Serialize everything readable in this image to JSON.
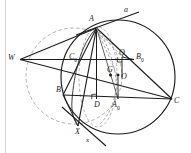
{
  "figure": {
    "kind": "euclidean-geometry-diagram",
    "width": 191,
    "height": 153,
    "background": "#ffffff",
    "stroke_dark": "#1c1c1c",
    "stroke_mid": "#555555",
    "stroke_dashed": "#8a8a8a",
    "margin_rule_color": "#c9c9c9"
  },
  "labels": {
    "A": "A",
    "a_line": "a",
    "B": "B",
    "C": "C",
    "W": "W",
    "O": "O",
    "G": "G",
    "Q": "Q",
    "D": "D",
    "X": "X",
    "x_line": "x",
    "A0_base": "A",
    "A0_sub": "0",
    "B0_base": "B",
    "B0_sub": "0",
    "C0_base": "C",
    "C0_sub": "0"
  },
  "points": [
    {
      "name": "A",
      "x": 96.5,
      "y": 28.0,
      "label": "A",
      "label_dx": -7.5,
      "label_dy": -9.5,
      "marked": false
    },
    {
      "name": "B",
      "x": 63.0,
      "y": 95.0,
      "label": "B",
      "label_dx": -8.0,
      "label_dy": -1.0,
      "marked": false
    },
    {
      "name": "C",
      "x": 172.0,
      "y": 99.0,
      "label": "C",
      "label_dx": 2.5,
      "label_dy": 3.0,
      "marked": false
    },
    {
      "name": "W",
      "x": 20.0,
      "y": 59.5,
      "label": "W",
      "label_dx": -10.0,
      "label_dy": -1.0,
      "marked": false
    },
    {
      "name": "O",
      "x": 118.0,
      "y": 77.0,
      "label": "O",
      "label_dx": 3.0,
      "label_dy": 3.5,
      "marked": true
    },
    {
      "name": "G",
      "x": 110.5,
      "y": 75.0,
      "label": "G",
      "label_dx": -1.5,
      "label_dy": -3.0,
      "marked": true
    },
    {
      "name": "Q",
      "x": 122.0,
      "y": 57.0,
      "label": "Q",
      "label_dx": -1.0,
      "label_dy": -3.0,
      "marked": false
    },
    {
      "name": "D",
      "x": 96.5,
      "y": 99.0,
      "label": "D",
      "label_dx": -1.0,
      "label_dy": 8.0,
      "marked": false
    },
    {
      "name": "X",
      "x": 78.0,
      "y": 126.0,
      "label": "X",
      "label_dx": -2.0,
      "label_dy": 8.0,
      "marked": false
    },
    {
      "name": "A0",
      "x": 118.0,
      "y": 99.0,
      "label": "A0",
      "label_dx": 0.5,
      "label_dy": 8.0,
      "marked": false
    },
    {
      "name": "B0",
      "x": 134.0,
      "y": 59.5,
      "label": "B0",
      "label_dx": 3.0,
      "label_dy": -1.0,
      "marked": false
    },
    {
      "name": "C0",
      "x": 79.5,
      "y": 59.5,
      "label": "C0",
      "label_dx": -8.5,
      "label_dy": -1.5,
      "marked": false
    }
  ],
  "elements": {
    "circumcircle": {
      "cx": 118.0,
      "cy": 77.0,
      "r": 57.0,
      "style": "solid"
    },
    "dashed_circle": {
      "cx": 74.0,
      "cy": 76.0,
      "r": 48.0,
      "style": "dashed"
    },
    "dashed_ellipse": {
      "cx": 98.0,
      "cy": 77.0,
      "rx": 19.0,
      "ry": 50.0,
      "style": "dashed"
    },
    "inner_arc": {
      "style": "solid-thin"
    },
    "tangent_line_a": {
      "label": "a",
      "label_x": 126.0,
      "label_y": 13.0
    },
    "line_x": {
      "label": "x",
      "label_x": 88.0,
      "label_y": 141.0
    },
    "right_angle_marks": [
      {
        "at": "D",
        "x": 96.5,
        "y": 99.0
      },
      {
        "at": "Q",
        "x": 122.0,
        "y": 57.0
      }
    ]
  },
  "segments": [
    {
      "name": "side-AB",
      "from": "A",
      "to": "B",
      "style": "solid"
    },
    {
      "name": "side-BC",
      "from": "B",
      "to": "C",
      "style": "solid"
    },
    {
      "name": "side-CA",
      "from": "C",
      "to": "A",
      "style": "solid"
    },
    {
      "name": "midline-C0-B0",
      "from": "C0",
      "to": "B0",
      "style": "solid"
    },
    {
      "name": "altitude-A-D",
      "from": "A",
      "to": "D",
      "style": "solid"
    },
    {
      "name": "median-A-A0",
      "from": "A",
      "to": "A0",
      "style": "solid-thin"
    },
    {
      "name": "cevian-A-X",
      "from": "A",
      "to": "X",
      "style": "solid"
    },
    {
      "name": "segment-W-A",
      "from": "W",
      "to": "A",
      "style": "solid"
    },
    {
      "name": "segment-W-B0",
      "from": "W",
      "to": "B0",
      "style": "solid"
    },
    {
      "name": "segment-W-C",
      "from": "W",
      "to": "C",
      "style": "solid"
    },
    {
      "name": "segment-O-Q",
      "from": "O",
      "to": "Q",
      "style": "solid"
    },
    {
      "name": "segment-O-A0",
      "from": "O",
      "to": "A0",
      "style": "solid"
    },
    {
      "name": "segment-A-Q-dashed",
      "from": "A",
      "to": "Q",
      "style": "dashed"
    },
    {
      "name": "segment-A-G-O",
      "from": "A",
      "to": "O",
      "style": "dashed"
    }
  ]
}
